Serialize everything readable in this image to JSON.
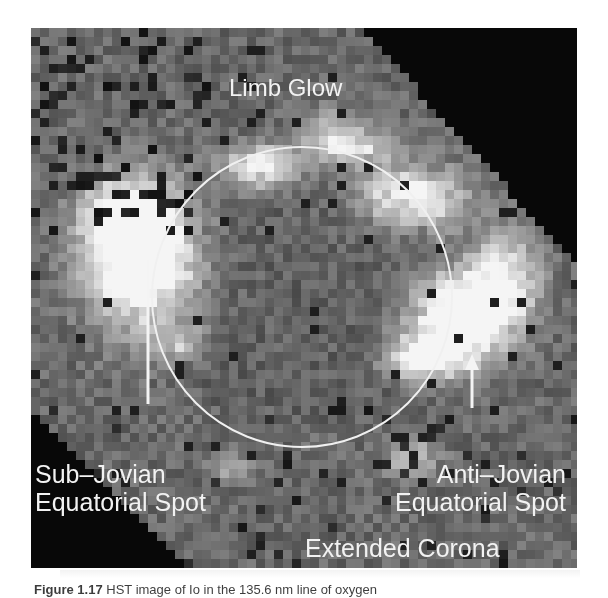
{
  "figure": {
    "labels": {
      "limb_glow": "Limb Glow",
      "sub_jovian_line1": "Sub–Jovian",
      "sub_jovian_line2": "Equatorial Spot",
      "anti_jovian_line1": "Anti–Jovian",
      "anti_jovian_line2": "Equatorial Spot",
      "extended_corona": "Extended Corona"
    },
    "caption": {
      "figure_number": "Figure 1.17",
      "text": " HST image of Io in the 135.6 nm line of oxygen"
    },
    "colors": {
      "background_gray": "#6e6e6e",
      "label_text": "#f2f2f2",
      "outline_circle": "#f0f0f0",
      "bright_emission": "#f4f4f4",
      "dark_region": "#0a0a0a"
    },
    "disk_outline": {
      "cx": 271,
      "cy": 269,
      "r": 150
    },
    "sub_jovian_pointer": {
      "x": 117,
      "y1": 232,
      "y2": 376
    },
    "anti_jovian_pointer": {
      "x": 441,
      "y1": 326,
      "y2": 380
    },
    "pixel_size": 9
  }
}
